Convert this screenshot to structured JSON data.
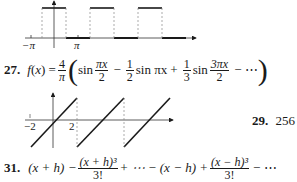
{
  "graph_square_wave": {
    "x_labels": {
      "neg_pi": "−π",
      "pi": "π"
    }
  },
  "problem_27": {
    "number": "27.",
    "lhs": "f(x) =",
    "coef_num": "4",
    "coef_den": "π",
    "term1_fn": "sin",
    "term1_num": "πx",
    "term1_den": "2",
    "op1": "−",
    "term2_num": "1",
    "term2_den": "2",
    "term2_fn": "sin πx",
    "op2": "+",
    "term3_num": "1",
    "term3_den": "3",
    "term3_fn": "sin",
    "term3_arg_num": "3πx",
    "term3_arg_den": "2",
    "tail": "− ⋯"
  },
  "graph_sawtooth": {
    "x_labels": {
      "neg_two": "−2",
      "two": "2"
    },
    "y_tick": "1"
  },
  "problem_29": {
    "number": "29.",
    "answer": "256"
  },
  "problem_31": {
    "number": "31.",
    "t1": "(x + h) −",
    "f1_num": "(x + h)³",
    "f1_den": "3!",
    "mid": "+ ⋯ − (x − h) +",
    "f2_num": "(x − h)³",
    "f2_den": "3!",
    "tail": "− ⋯"
  }
}
